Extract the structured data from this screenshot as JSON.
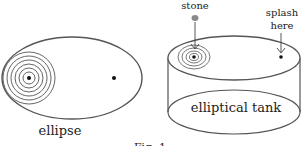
{
  "figure": {
    "caption": "Fig. 1",
    "left_panel": {
      "label": "ellipse",
      "ripple_rings": 6
    },
    "right_panel": {
      "label": "elliptical tank",
      "stone_label": "stone",
      "splash_label_line1": "splash",
      "splash_label_line2": "here",
      "ripple_rings": 4
    },
    "colors": {
      "stroke": "#555555",
      "dot": "#111111",
      "stone": "#8a8a8a"
    }
  }
}
